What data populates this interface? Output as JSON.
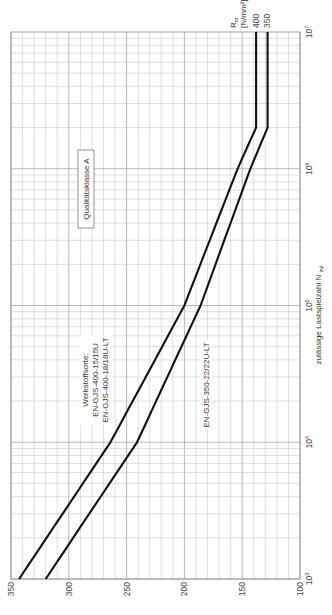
{
  "chart_data": {
    "type": "line",
    "orientation": "rotated-90-ccw",
    "title": "",
    "xlabel": "zulässige Lastspielzahl N",
    "xlabel_subscript": "zul",
    "ylabel": "R",
    "ylabel_subscript": "m",
    "ylabel_unit": "[N/mm²]",
    "x_scale": "log",
    "xlim": [
      1000,
      10000000
    ],
    "ylim": [
      100,
      350
    ],
    "x_ticks": [
      {
        "base": "10",
        "exp": "3",
        "value": 1000
      },
      {
        "base": "10",
        "exp": "4",
        "value": 10000
      },
      {
        "base": "10",
        "exp": "5",
        "value": 100000
      },
      {
        "base": "10",
        "exp": "6",
        "value": 1000000
      },
      {
        "base": "10",
        "exp": "7",
        "value": 10000000
      }
    ],
    "y_ticks": [
      "350",
      "300",
      "250",
      "200",
      "150",
      "100"
    ],
    "y_tick_values": [
      350,
      300,
      250,
      200,
      150,
      100
    ],
    "grid": true,
    "series": [
      {
        "name": "R_m = 400",
        "end_label": "400",
        "points": [
          [
            1000,
            343
          ],
          [
            10000,
            264
          ],
          [
            100000,
            200
          ],
          [
            1000000,
            154
          ],
          [
            2000000,
            138
          ],
          [
            10000000,
            138
          ]
        ]
      },
      {
        "name": "R_m = 350",
        "end_label": "350",
        "points": [
          [
            1000,
            320
          ],
          [
            10000,
            241
          ],
          [
            100000,
            186
          ],
          [
            1000000,
            143
          ],
          [
            2000000,
            128
          ],
          [
            10000000,
            128
          ]
        ]
      }
    ],
    "annotations": {
      "quality_class": "Qualitätsklasse A",
      "material_heading": "Werkstoffsorte:",
      "material_line1": "EN-GJS-400-15/15U",
      "material_line2": "EN-GJS-400-18/18U-LT",
      "material_alt": "EN-GJS-350-22/22U-LT"
    }
  }
}
